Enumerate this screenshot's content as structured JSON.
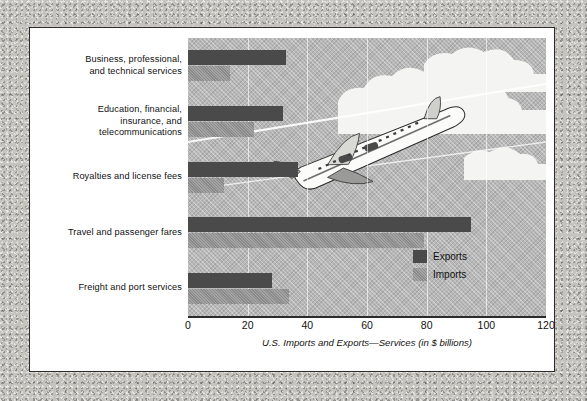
{
  "figure": {
    "caption": "U.S. Imports and Exports—Services (in $ billions)"
  },
  "legend": {
    "position": "inside-right",
    "items": [
      {
        "label": "Exports",
        "color": "#4a4a4a",
        "name": "exports"
      },
      {
        "label": "Imports",
        "color": "#8a8a8a",
        "name": "imports"
      }
    ]
  },
  "artwork": {
    "plane": "airplane-illustration",
    "clouds": "cloud-illustration",
    "sky": "sky-background"
  },
  "chart_data": {
    "type": "bar",
    "orientation": "horizontal",
    "title": "",
    "subtitle": "",
    "xlabel": "U.S. Imports and Exports—Services (in $ billions)",
    "ylabel": "",
    "xlim": [
      0,
      120
    ],
    "xticks": [
      0,
      20,
      40,
      60,
      80,
      100,
      120
    ],
    "xtick_labels": [
      "0",
      "20",
      "40",
      "60",
      "80",
      "100",
      "120"
    ],
    "grid": true,
    "grid_axis": "x",
    "legend_position": "inside-right",
    "categories": [
      "Business, professional, and technical services",
      "Education, financial, insurance, and telecommunications",
      "Royalties and license fees",
      "Travel and passenger fares",
      "Freight and port services"
    ],
    "category_lines": [
      [
        "Business, professional,",
        "and technical services"
      ],
      [
        "Education, financial,",
        "insurance, and",
        "telecommunications"
      ],
      [
        "Royalties and license fees"
      ],
      [
        "Travel and passenger fares"
      ],
      [
        "Freight and port services"
      ]
    ],
    "series": [
      {
        "name": "Exports",
        "color": "#4a4a4a",
        "values": [
          33,
          32,
          37,
          95,
          28
        ]
      },
      {
        "name": "Imports",
        "color": "#8a8a8a",
        "values": [
          14,
          22,
          12,
          79,
          34
        ]
      }
    ],
    "units": "$ billions"
  }
}
